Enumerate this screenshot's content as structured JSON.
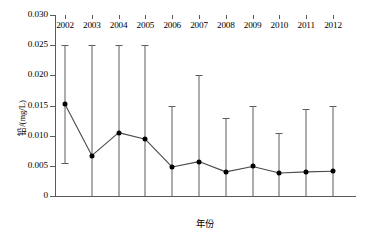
{
  "chart_data": {
    "type": "line",
    "title": "",
    "xlabel": "年份",
    "ylabel": "铅/(mg/L)",
    "categories": [
      "2002",
      "2003",
      "2004",
      "2005",
      "2006",
      "2007",
      "2008",
      "2009",
      "2010",
      "2011",
      "2012"
    ],
    "values": [
      0.0152,
      0.0067,
      0.0105,
      0.0094,
      0.0048,
      0.0057,
      0.004,
      0.0049,
      0.0038,
      0.004,
      0.0041
    ],
    "error_upper": [
      0.025,
      0.025,
      0.025,
      0.025,
      0.015,
      0.02,
      0.013,
      0.015,
      0.0105,
      0.0145,
      0.015
    ],
    "error_lower": [
      0.0055,
      0.0,
      0.0,
      0.0,
      0.0,
      0.0,
      0.0,
      0.0,
      0.0,
      0.0,
      0.0
    ],
    "ylim": [
      0,
      0.03
    ],
    "ytick_labels": [
      "0",
      "0.005",
      "0.010",
      "0.015",
      "0.020",
      "0.025",
      "0.030"
    ],
    "ytick_values": [
      0,
      0.005,
      0.01,
      0.015,
      0.02,
      0.025,
      0.03
    ],
    "grid": false,
    "legend": null,
    "marker": "filled-circle",
    "line_color": "#4a4a4a",
    "marker_color": "#000000",
    "errorbar_color": "#5d5d5d",
    "axis_color": "#5a5a5a"
  }
}
